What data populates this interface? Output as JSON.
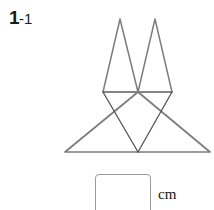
{
  "problem": {
    "number_main": "1",
    "number_separator": "-",
    "number_sub": "1"
  },
  "figure": {
    "name": "triangle-net-diagram",
    "stroke_color": "#7c7c7c",
    "inner_stroke_color": "#555555",
    "stroke_width": 1.6,
    "inner_stroke_width": 1.2,
    "fill": "none",
    "shapes": [
      {
        "name": "large-outer-triangle",
        "points": "65,152 210,152 138,92"
      },
      {
        "name": "inner-inverted-triangle",
        "points": "103,92 172,92 138,152"
      },
      {
        "name": "top-horizontal-edge",
        "points": "103,92 172,92"
      },
      {
        "name": "left-flap-triangle",
        "points": "103,92 138,92 120,19"
      },
      {
        "name": "right-flap-triangle",
        "points": "138,92 172,92 155,19"
      }
    ]
  },
  "answer": {
    "box_value": "",
    "box_placeholder": "",
    "unit_label": "cm"
  }
}
